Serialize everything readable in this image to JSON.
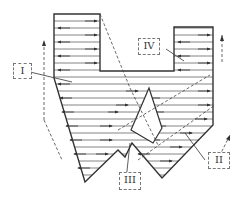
{
  "diagram": {
    "type": "flow-pattern-schematic",
    "stroke_color": "#333333",
    "hatch_color": "#555555",
    "labels": [
      {
        "id": "I",
        "text": "I"
      },
      {
        "id": "II",
        "text": "II"
      },
      {
        "id": "III",
        "text": "III"
      },
      {
        "id": "IV",
        "text": "IV"
      }
    ]
  }
}
